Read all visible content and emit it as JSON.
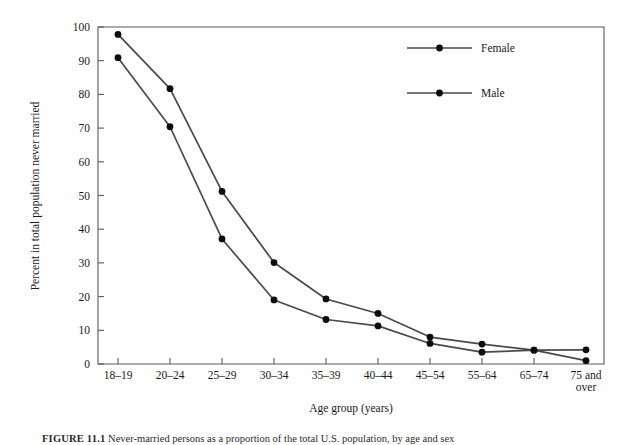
{
  "figure": {
    "caption_label": "FIGURE 11.1",
    "caption_text": "Never-married persons as a proportion of the total U.S. population, by age and sex"
  },
  "chart_data": {
    "type": "line",
    "title": "",
    "xlabel": "Age group (years)",
    "ylabel": "Percent in total population never married",
    "categories": [
      "18–19",
      "20–24",
      "25–29",
      "30–34",
      "35–39",
      "40–44",
      "45–54",
      "55–64",
      "65–74",
      "75 and over"
    ],
    "xtick_labels": [
      "18–19",
      "20–24",
      "25–29",
      "30–34",
      "35–39",
      "40–44",
      "45–54",
      "55–64",
      "65–74",
      "75 and\nover"
    ],
    "ylim": [
      0,
      100
    ],
    "ytick_labels": [
      "0",
      "10",
      "20",
      "30",
      "40",
      "50",
      "60",
      "70",
      "80",
      "90",
      "100"
    ],
    "yticks": [
      0,
      10,
      20,
      30,
      40,
      50,
      60,
      70,
      80,
      90,
      100
    ],
    "grid": false,
    "legend_position": "top-right-inside",
    "marker": "filled-circle",
    "line_color": "#4a4a4a",
    "marker_color": "#0d0d0d",
    "series": [
      {
        "name": "Male",
        "values": [
          97.8,
          81.7,
          51.2,
          30.1,
          19.3,
          15.0,
          8.0,
          5.9,
          4.1,
          4.2
        ]
      },
      {
        "name": "Female",
        "values": [
          90.9,
          70.4,
          37.1,
          19.0,
          13.2,
          11.3,
          6.1,
          3.5,
          4.1,
          1.0
        ]
      }
    ]
  },
  "legend": {
    "entries": [
      {
        "label": "Female"
      },
      {
        "label": "Male"
      }
    ]
  }
}
